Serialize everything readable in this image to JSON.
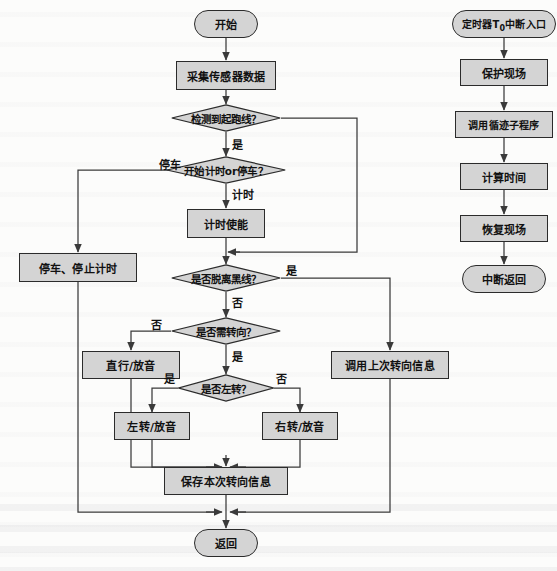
{
  "diagram": {
    "type": "flowchart",
    "title": "",
    "main_flow": {
      "start": "开始",
      "sample_sensor": "采集传感器数据",
      "detect_start_line": "检测到起跑线？",
      "start_timing_or_stop": "开始计时or停车？",
      "timing_enable": "计时使能",
      "stop_and_stop_timing": "停车、停止计时",
      "off_black_line": "是否脱离黑线？",
      "need_turn": "是否需转向？",
      "straight_play": "直行/放音",
      "call_last_turn_info": "调用上次转向信息",
      "turn_left_q": "是否左转？",
      "left_play": "左转/放音",
      "right_play": "右转/放音",
      "save_turn_info": "保存本次转向信息",
      "return": "返回"
    },
    "isr_flow": {
      "entry_prefix": "定时器T",
      "entry_sub": "0",
      "entry_suffix": "中断入口",
      "protect_context": "保护现场",
      "call_tracking_sub": "调用循迹子程序",
      "compute_time": "计算时间",
      "restore_context": "恢复现场",
      "interrupt_return": "中断返回"
    },
    "edge_labels": {
      "yes": "是",
      "no": "否",
      "stop_car": "停车",
      "timing": "计时"
    },
    "colors": {
      "node_fill": "#d4d4d4",
      "node_stroke": "#2b2b2b",
      "wire": "#3a3a3a",
      "text": "#111111",
      "page_bg": "#fcfcfb"
    }
  }
}
